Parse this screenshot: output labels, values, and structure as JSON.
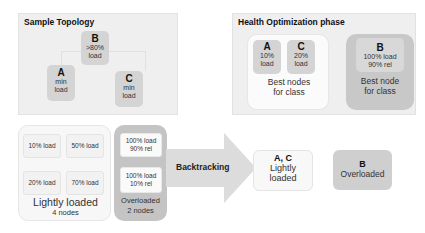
{
  "sample_topology": {
    "title": "Sample Topology",
    "nodes": [
      {
        "id": "B",
        "label": "B",
        "detail_1": ">80%",
        "detail_2": "load"
      },
      {
        "id": "A",
        "label": "A",
        "detail_1": "min",
        "detail_2": "load"
      },
      {
        "id": "C",
        "label": "C",
        "detail_1": "min",
        "detail_2": "load"
      }
    ]
  },
  "health_optimization": {
    "title": "Health Optimization phase",
    "light_group": {
      "nodes": [
        {
          "label": "A",
          "detail_1": "10%",
          "detail_2": "load"
        },
        {
          "label": "C",
          "detail_1": "20%",
          "detail_2": "load"
        }
      ],
      "caption_1": "Best nodes",
      "caption_2": "for class"
    },
    "heavy_group": {
      "node": {
        "label": "B",
        "detail_1": "100% load",
        "detail_2": "90% rel"
      },
      "caption_1": "Best node",
      "caption_2": "for class"
    }
  },
  "classification": {
    "lightly_loaded": {
      "items": [
        "10% load",
        "50% load",
        "20% load",
        "70% load"
      ],
      "caption": "Lightly loaded",
      "count": "4 nodes"
    },
    "overloaded": {
      "items": [
        {
          "line_1": "100% load",
          "line_2": "90% rel"
        },
        {
          "line_1": "100% load",
          "line_2": "10% rel"
        }
      ],
      "caption": "Overloaded",
      "count": "2 nodes"
    }
  },
  "arrow": {
    "label": "Backtracking"
  },
  "results": [
    {
      "title": "A, C",
      "line_1": "Lightly",
      "line_2": "loaded"
    },
    {
      "title": "B",
      "line_1": "Overloaded"
    }
  ],
  "colors": {
    "panel_bg": "#efefef",
    "node_gray": "#d4d4d4",
    "overloaded_gray": "#c4c4c4",
    "arrow_gray": "#dcdcdc",
    "light_bg": "#f7f7f7"
  }
}
